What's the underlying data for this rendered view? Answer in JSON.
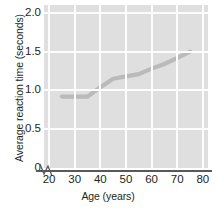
{
  "chart_data": {
    "type": "line",
    "title": "",
    "subtitle": "",
    "xlabel": "Age (years)",
    "ylabel": "Average reaction time (seconds)",
    "xlim": [
      18,
      82
    ],
    "ylim": [
      0,
      2.1
    ],
    "xticks": [
      "20",
      "30",
      "40",
      "50",
      "60",
      "70",
      "80"
    ],
    "xtick_values": [
      20,
      30,
      40,
      50,
      60,
      70,
      80
    ],
    "yticks": [
      "0",
      "0.5",
      "1.0",
      "1.5",
      "2.0"
    ],
    "ytick_values": [
      0,
      0.5,
      1.0,
      1.5,
      2.0
    ],
    "grid": "both",
    "legend": "none",
    "annotations": [
      "axis-break-at-origin"
    ],
    "series": [
      {
        "name": "Average reaction time",
        "color": "#b9babc",
        "x": [
          25,
          30,
          35,
          40,
          45,
          50,
          55,
          60,
          65,
          70,
          75
        ],
        "values": [
          0.92,
          0.92,
          0.92,
          1.04,
          1.15,
          1.18,
          1.21,
          1.28,
          1.34,
          1.42,
          1.5
        ]
      }
    ]
  },
  "colors": {
    "plot_background": "#dfdfe0",
    "gridline": "#fdfdfd",
    "axis": "#58595b",
    "text": "#231f20",
    "line": "#b9babc"
  }
}
